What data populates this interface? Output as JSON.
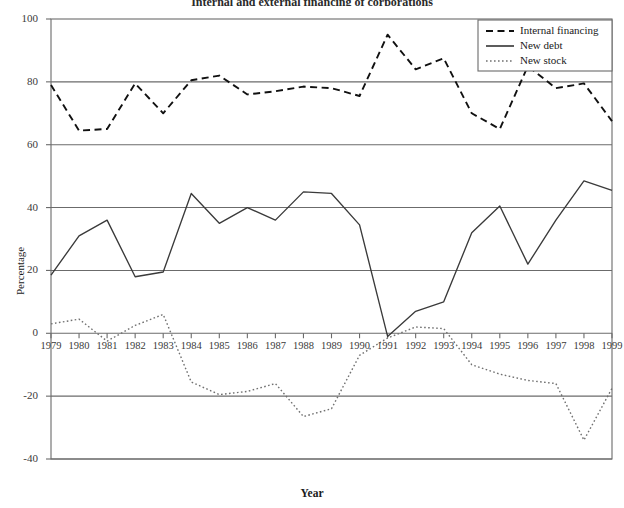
{
  "chart_data": {
    "type": "line",
    "title": "Internal and external financing of corporations",
    "xlabel": "Year",
    "ylabel": "Percentage",
    "x": [
      1979,
      1980,
      1981,
      1982,
      1983,
      1984,
      1985,
      1986,
      1987,
      1988,
      1989,
      1990,
      1991,
      1992,
      1993,
      1994,
      1995,
      1996,
      1997,
      1998,
      1999
    ],
    "xtick_labels": [
      "1979",
      "1980",
      "1981",
      "1982",
      "1983",
      "1984",
      "1985",
      "1986",
      "1987",
      "1988",
      "1989",
      "1990",
      "1991",
      "1992",
      "1993",
      "1994",
      "1995",
      "1996",
      "1997",
      "1998",
      "1999"
    ],
    "ytick_labels": [
      "100",
      "80",
      "60",
      "40",
      "20",
      "0",
      "-20",
      "-40"
    ],
    "ytick_values": [
      100,
      80,
      60,
      40,
      20,
      0,
      -20,
      -40
    ],
    "ylim": [
      -40,
      100
    ],
    "xlim": [
      1979,
      1999
    ],
    "grid": "horizontal-only",
    "legend_position": "top-right",
    "series": [
      {
        "name": "Internal financing",
        "style": "dashed",
        "color": "#111111",
        "values": [
          79,
          64.5,
          65,
          79.5,
          70,
          80.5,
          82,
          76,
          77,
          78.5,
          78,
          75.5,
          95,
          84,
          87.5,
          70,
          65,
          85,
          78,
          79.5,
          67.5
        ]
      },
      {
        "name": "New debt",
        "style": "solid",
        "color": "#3a3a3a",
        "values": [
          18.5,
          31,
          36,
          18,
          19.5,
          44.5,
          35,
          40,
          36,
          45,
          44.5,
          34.5,
          -1,
          7,
          10,
          32,
          40.5,
          22,
          36,
          48.5,
          45.5
        ]
      },
      {
        "name": "New stock",
        "style": "dotted",
        "color": "#707070",
        "values": [
          3,
          4.5,
          -2.5,
          2.5,
          6,
          -15.5,
          -19.5,
          -18.5,
          -16,
          -26.5,
          -24,
          -7,
          -1.5,
          2,
          1.5,
          -10,
          -13,
          -15,
          -16,
          -34,
          -17.5
        ]
      }
    ]
  },
  "axes_geometry": {
    "plot_left": 51,
    "plot_right": 612,
    "plot_top": 19,
    "plot_bottom": 459,
    "y_top_value": 100,
    "y_bottom_value": -40
  },
  "colors": {
    "axis": "#6b6b6b",
    "grid": "#6b6b6b",
    "text": "#1a1a1a",
    "background": "#ffffff"
  }
}
